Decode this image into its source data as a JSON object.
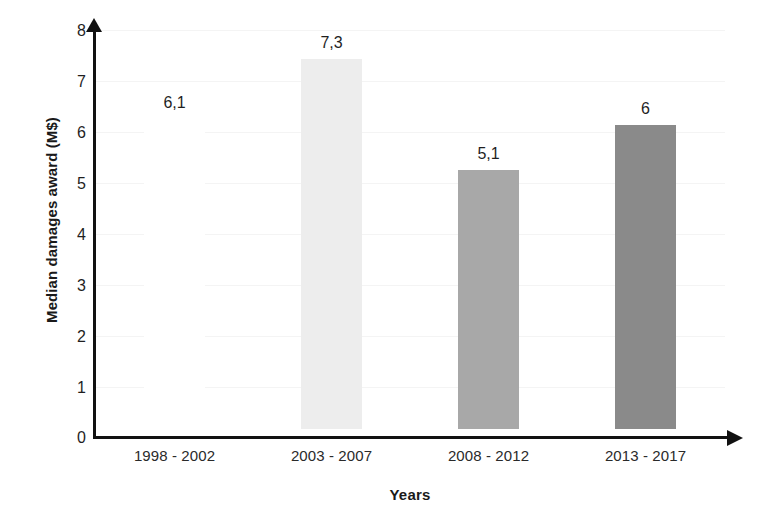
{
  "chart_data": {
    "type": "bar",
    "title": "",
    "xlabel": "Years",
    "ylabel": "Median damages award (M$)",
    "categories": [
      "1998 - 2002",
      "2003 - 2007",
      "2008 - 2012",
      "2013 - 2017"
    ],
    "values": [
      6.1,
      7.3,
      5.1,
      6
    ],
    "value_labels": [
      "6,1",
      "7,3",
      "5,1",
      "6"
    ],
    "series": [
      {
        "name": "Median damages award",
        "values": [
          6.1,
          7.3,
          5.1,
          6
        ]
      }
    ],
    "bar_colors": [
      "#ffffff",
      "#ededed",
      "#a8a8a8",
      "#8a8a8a"
    ],
    "ylim": [
      0,
      8
    ],
    "ytick_step": 1,
    "ytick_labels": [
      "8",
      "7",
      "6",
      "5",
      "4",
      "3",
      "2",
      "1",
      "0"
    ],
    "ytick_values": [
      8,
      7,
      6,
      5,
      4,
      3,
      2,
      1,
      0
    ],
    "grid": true,
    "grid_color": "#f4f4f4",
    "legend": false,
    "legend_position": "none",
    "axis_color": "#111111",
    "axis_arrows": true,
    "decimal_separator": ","
  }
}
